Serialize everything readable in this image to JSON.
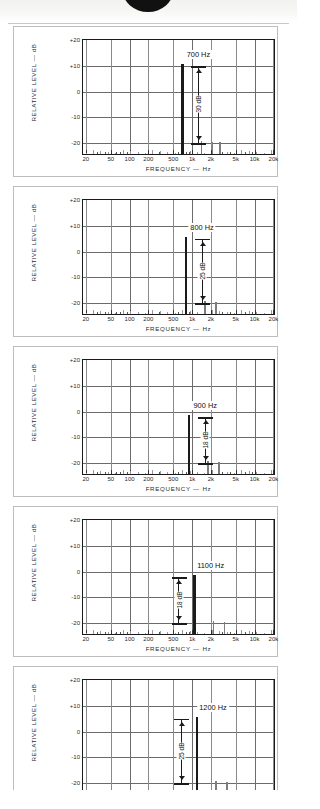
{
  "page": {
    "artifact_top": "scanned-page-edge"
  },
  "axes": {
    "ylabel": "RELATIVE LEVEL — dB",
    "xlabel": "FREQUENCY — Hz",
    "yticks": [
      "+20",
      "+10",
      "0",
      "-10",
      "-20"
    ],
    "yvalues": [
      20,
      10,
      0,
      -10,
      -20
    ],
    "ylim": [
      -25,
      20
    ],
    "xticks": [
      "20",
      "50",
      "100",
      "200",
      "500",
      "1k",
      "2k",
      "5k",
      "10k",
      "20k"
    ],
    "xvalues": [
      20,
      50,
      100,
      200,
      500,
      1000,
      2000,
      5000,
      10000,
      20000
    ],
    "xlim": [
      18,
      22000
    ]
  },
  "colors": {
    "frame": "#1a1a1a",
    "grid": "#6b6b6b",
    "minor_grid": "#8a8a8a",
    "fundamental": "#1a1a1a",
    "harmonic": "#7d7d7d",
    "card_border": "#bdbdbd",
    "background": "#ffffff"
  },
  "chart_data": [
    {
      "type": "bar",
      "title": "700 Hz",
      "xlabel": "FREQUENCY — Hz",
      "ylabel": "RELATIVE LEVEL — dB",
      "ylim": [
        -25,
        20
      ],
      "xlim": [
        18,
        22000
      ],
      "grid": true,
      "legend": "none",
      "annotation": {
        "label": "30 dB",
        "top_db": 10,
        "bottom_db": -20,
        "side": "right"
      },
      "series": [
        {
          "name": "fundamental",
          "x": [
            700
          ],
          "values": [
            10
          ]
        },
        {
          "name": "harmonics",
          "x": [
            1400,
            2100,
            2800
          ],
          "values": [
            -20,
            -20.5,
            -20.5
          ]
        }
      ]
    },
    {
      "type": "bar",
      "title": "800 Hz",
      "xlabel": "FREQUENCY — Hz",
      "ylabel": "RELATIVE LEVEL — dB",
      "ylim": [
        -25,
        20
      ],
      "xlim": [
        18,
        22000
      ],
      "grid": true,
      "legend": "none",
      "annotation": {
        "label": "25 dB",
        "top_db": 5,
        "bottom_db": -20,
        "side": "right"
      },
      "series": [
        {
          "name": "fundamental",
          "x": [
            800
          ],
          "values": [
            5
          ]
        },
        {
          "name": "harmonics",
          "x": [
            1600,
            2400
          ],
          "values": [
            -20,
            -20.5
          ]
        }
      ]
    },
    {
      "type": "bar",
      "title": "900 Hz",
      "xlabel": "FREQUENCY — Hz",
      "ylabel": "RELATIVE LEVEL — dB",
      "ylim": [
        -25,
        20
      ],
      "xlim": [
        18,
        22000
      ],
      "grid": true,
      "legend": "none",
      "annotation": {
        "label": "18 dB",
        "top_db": -2,
        "bottom_db": -20,
        "side": "right"
      },
      "series": [
        {
          "name": "fundamental",
          "x": [
            900
          ],
          "values": [
            -2
          ]
        },
        {
          "name": "harmonics",
          "x": [
            1800,
            2700
          ],
          "values": [
            -20,
            -20.5
          ]
        }
      ]
    },
    {
      "type": "bar",
      "title": "1100 Hz",
      "xlabel": "FREQUENCY — Hz",
      "ylabel": "RELATIVE LEVEL — dB",
      "ylim": [
        -25,
        20
      ],
      "xlim": [
        18,
        22000
      ],
      "grid": true,
      "legend": "none",
      "annotation": {
        "label": "18 dB",
        "top_db": -2,
        "bottom_db": -20,
        "side": "left"
      },
      "series": [
        {
          "name": "fundamental",
          "x": [
            1100
          ],
          "values": [
            -2
          ]
        },
        {
          "name": "harmonics",
          "x": [
            2200,
            3300
          ],
          "values": [
            -20,
            -20.5
          ]
        }
      ]
    },
    {
      "type": "bar",
      "title": "1200 Hz",
      "xlabel": "FREQUENCY — Hz",
      "ylabel": "RELATIVE LEVEL — dB",
      "ylim": [
        -25,
        20
      ],
      "xlim": [
        18,
        22000
      ],
      "grid": true,
      "legend": "none",
      "annotation": {
        "label": "25 dB",
        "top_db": 5,
        "bottom_db": -20,
        "side": "left"
      },
      "series": [
        {
          "name": "fundamental",
          "x": [
            1200
          ],
          "values": [
            5
          ]
        },
        {
          "name": "harmonics",
          "x": [
            2400,
            3600
          ],
          "values": [
            -20,
            -20.5
          ]
        }
      ]
    }
  ]
}
